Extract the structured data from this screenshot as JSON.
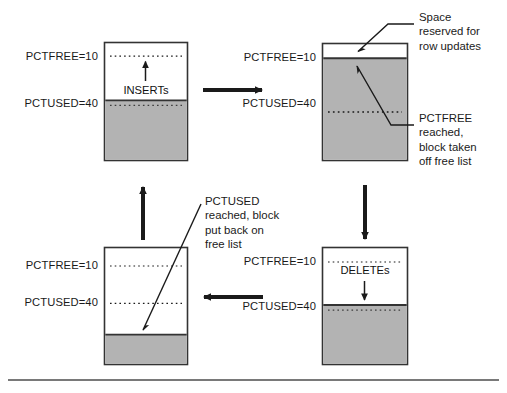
{
  "figure": {
    "colors": {
      "block_border": "#333333",
      "used_fill": "#b3b3b3",
      "free_fill": "#ffffff",
      "line": "#1a1a1a",
      "text": "#1a1a1a",
      "rule": "#4d4d4d"
    },
    "blocks": [
      {
        "id": "block-inserts",
        "pctfree_label": "PCTFREE=10",
        "pctused_label": "PCTUSED=40",
        "operation_label": "INSERTs",
        "operation_arrow": "up"
      },
      {
        "id": "block-pctfree-reached",
        "pctfree_label": "PCTFREE=10",
        "pctused_label": "PCTUSED=40",
        "operation_label": "",
        "operation_arrow": "none"
      },
      {
        "id": "block-deletes",
        "pctfree_label": "PCTFREE=10",
        "pctused_label": "PCTUSED=40",
        "operation_label": "DELETEs",
        "operation_arrow": "down"
      },
      {
        "id": "block-pctused-reached",
        "pctfree_label": "PCTFREE=10",
        "pctused_label": "PCTUSED=40",
        "operation_label": "",
        "operation_arrow": "none"
      }
    ],
    "callouts": [
      {
        "id": "callout-space-reserved",
        "text": "Space\nreserved for\nrow updates"
      },
      {
        "id": "callout-pctfree-reached",
        "text": "PCTFREE\nreached,\nblock taken\noff free list"
      },
      {
        "id": "callout-pctused-reached",
        "text": "PCTUSED\nreached, block\nput back on\nfree list"
      }
    ],
    "flow_arrows": [
      {
        "id": "arrow-inserts-to-pctfree",
        "direction": "right"
      },
      {
        "id": "arrow-pctfree-to-deletes",
        "direction": "down"
      },
      {
        "id": "arrow-deletes-to-pctused",
        "direction": "left"
      },
      {
        "id": "arrow-pctused-to-inserts",
        "direction": "up"
      }
    ]
  }
}
